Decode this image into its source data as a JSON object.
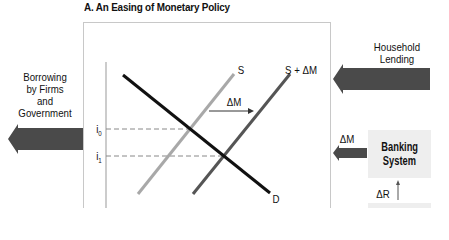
{
  "title": "A.  An Easing of Monetary Policy",
  "left_flow": {
    "label_lines": [
      "Borrowing",
      "by Firms",
      "and",
      "Government"
    ],
    "arrow_color": "#4a4a4a"
  },
  "right_flow": {
    "household_label_lines": [
      "Household",
      "Lending"
    ],
    "delta_m_label": "ΔM",
    "banking_box_lines": [
      "Banking",
      "System"
    ],
    "delta_r_label": "ΔR",
    "arrow_color": "#4a4a4a",
    "box_color": "#eeeeee"
  },
  "graph": {
    "supply_label": "S",
    "shifted_supply_label": "S + ΔM",
    "demand_label": "D",
    "shift_label": "ΔM",
    "y_ticks": [
      "i0",
      "i1"
    ],
    "i0_label": "i",
    "i0_sub": "0",
    "i1_label": "i",
    "i1_sub": "1",
    "colors": {
      "supply": "#a8a8a8",
      "shifted_supply": "#555555",
      "demand": "#111111",
      "dashed": "#888888"
    }
  }
}
